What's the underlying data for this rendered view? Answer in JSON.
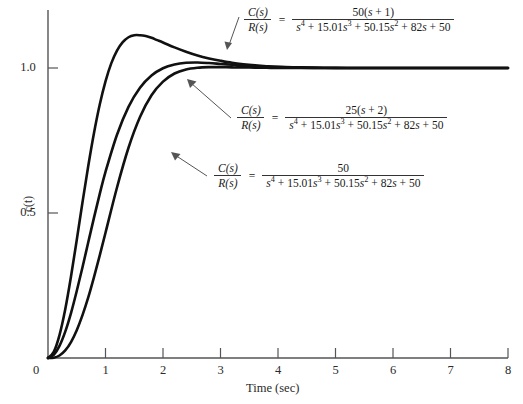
{
  "chart_data": {
    "type": "line",
    "title": "",
    "xlabel": "Time (sec)",
    "ylabel": "c(t)",
    "xlim": [
      0,
      8
    ],
    "ylim": [
      0,
      1.16
    ],
    "grid": false,
    "legend_position": "inline-annotations",
    "xticks": [
      0,
      1,
      2,
      3,
      4,
      5,
      6,
      7,
      8
    ],
    "xticklabels": [
      "0",
      "1",
      "2",
      "3",
      "4",
      "5",
      "6",
      "7",
      "8"
    ],
    "yticks": [
      0,
      0.5,
      1.0
    ],
    "yticklabels": [
      "0",
      "0.5",
      "1.0"
    ],
    "series": [
      {
        "name": "50(s + 1) numerator",
        "annotation_index": 0,
        "peak_value": 1.11,
        "peak_time": 2.0,
        "x": [
          0,
          0.1,
          0.2,
          0.3,
          0.4,
          0.5,
          0.6,
          0.7,
          0.8,
          0.9,
          1.0,
          1.1,
          1.2,
          1.3,
          1.4,
          1.5,
          1.6,
          1.7,
          1.8,
          1.9,
          2.0,
          2.2,
          2.4,
          2.6,
          2.8,
          3.0,
          3.2,
          3.4,
          3.6,
          3.8,
          4.0,
          4.4,
          4.8,
          5.2,
          5.6,
          6.0,
          6.5,
          7.0,
          7.5,
          8.0
        ],
        "y": [
          0,
          0.021,
          0.079,
          0.168,
          0.281,
          0.407,
          0.537,
          0.662,
          0.776,
          0.874,
          0.954,
          1.016,
          1.06,
          1.089,
          1.106,
          1.113,
          1.113,
          1.11,
          1.104,
          1.096,
          1.088,
          1.071,
          1.056,
          1.043,
          1.033,
          1.025,
          1.018,
          1.013,
          1.009,
          1.006,
          1.004,
          1.002,
          1.001,
          1.0,
          1.0,
          1.0,
          1.0,
          1.0,
          1.0,
          1.0
        ]
      },
      {
        "name": "25(s + 2) numerator",
        "annotation_index": 1,
        "peak_value": 1.02,
        "peak_time": 2.6,
        "x": [
          0,
          0.1,
          0.2,
          0.3,
          0.4,
          0.5,
          0.6,
          0.7,
          0.8,
          0.9,
          1.0,
          1.2,
          1.4,
          1.6,
          1.8,
          2.0,
          2.2,
          2.4,
          2.6,
          2.8,
          3.0,
          3.2,
          3.4,
          3.6,
          3.8,
          4.0,
          4.4,
          4.8,
          5.2,
          5.6,
          6.0,
          6.5,
          7.0,
          7.5,
          8.0
        ],
        "y": [
          0,
          0.011,
          0.042,
          0.091,
          0.155,
          0.231,
          0.313,
          0.399,
          0.484,
          0.566,
          0.642,
          0.77,
          0.866,
          0.932,
          0.974,
          0.999,
          1.012,
          1.018,
          1.019,
          1.017,
          1.014,
          1.011,
          1.008,
          1.006,
          1.004,
          1.003,
          1.001,
          1.0,
          1.0,
          1.0,
          1.0,
          1.0,
          1.0,
          1.0,
          1.0
        ]
      },
      {
        "name": "50 numerator",
        "annotation_index": 2,
        "peak_value": 1.0,
        "peak_time": 4.0,
        "x": [
          0,
          0.1,
          0.2,
          0.3,
          0.4,
          0.5,
          0.6,
          0.7,
          0.8,
          0.9,
          1.0,
          1.2,
          1.4,
          1.6,
          1.8,
          2.0,
          2.2,
          2.4,
          2.6,
          2.8,
          3.0,
          3.2,
          3.4,
          3.6,
          3.8,
          4.0,
          4.4,
          4.8,
          5.2,
          5.6,
          6.0,
          6.5,
          7.0,
          7.5,
          8.0
        ],
        "y": [
          0,
          0.0012,
          0.0086,
          0.026,
          0.055,
          0.096,
          0.148,
          0.209,
          0.279,
          0.354,
          0.432,
          0.588,
          0.725,
          0.831,
          0.906,
          0.953,
          0.981,
          0.995,
          1.001,
          1.003,
          1.003,
          1.002,
          1.002,
          1.001,
          1.001,
          1.0,
          1.0,
          1.0,
          1.0,
          1.0,
          1.0,
          1.0,
          1.0,
          1.0,
          1.0
        ]
      }
    ],
    "annotations": [
      {
        "lhs_num": "C(s)",
        "lhs_den": "R(s)",
        "equals": "=",
        "rhs_num": "50(s + 1)",
        "rhs_den": "s⁴ + 15.01s³ + 50.15s² + 82s + 50"
      },
      {
        "lhs_num": "C(s)",
        "lhs_den": "R(s)",
        "equals": "=",
        "rhs_num": "25(s + 2)",
        "rhs_den": "s⁴ + 15.01s³ + 50.15s² + 82s + 50"
      },
      {
        "lhs_num": "C(s)",
        "lhs_den": "R(s)",
        "equals": "=",
        "rhs_num": "50",
        "rhs_den": "s⁴ + 15.01s³ + 50.15s² + 82s + 50"
      }
    ]
  },
  "axes": {
    "x_axis_label": "Time (sec)",
    "y_axis_label": "c(t)",
    "x_tick_labels": [
      "0",
      "1",
      "2",
      "3",
      "4",
      "5",
      "6",
      "7",
      "8"
    ],
    "y_tick_labels": [
      "1.0",
      "0.5",
      "0"
    ]
  },
  "equations": [
    {
      "num_lhs": "C(s)",
      "den_lhs": "R(s)",
      "eq": "=",
      "num_rhs_parts": [
        "50(",
        "s",
        " + 1)"
      ],
      "den_rhs_plain": "s4 + 15.01s3 + 50.15s2 + 82s + 50"
    },
    {
      "num_lhs": "C(s)",
      "den_lhs": "R(s)",
      "eq": "=",
      "num_rhs_parts": [
        "25(",
        "s",
        " + 2)"
      ],
      "den_rhs_plain": "s4 + 15.01s3 + 50.15s2 + 82s + 50"
    },
    {
      "num_lhs": "C(s)",
      "den_lhs": "R(s)",
      "eq": "=",
      "num_rhs_parts": [
        "50",
        "",
        ""
      ],
      "den_rhs_plain": "s4 + 15.01s3 + 50.15s2 + 82s + 50"
    }
  ],
  "style": {
    "curve_color": "#111111",
    "axis_color": "#555555",
    "background": "#ffffff"
  }
}
